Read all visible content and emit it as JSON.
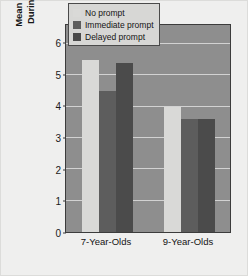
{
  "chart_data": {
    "type": "bar",
    "title": "",
    "xlabel": "",
    "ylabel": "Mean Number of Errors During Recall of List 1",
    "ylabel_lines": [
      "Mean Number of Errors",
      "During Recall of List 1"
    ],
    "categories": [
      "7-Year-Olds",
      "9-Year-Olds"
    ],
    "series": [
      {
        "name": "No prompt",
        "values": [
          5.5,
          4.0
        ],
        "color": "#d9d9d7"
      },
      {
        "name": "Immediate prompt",
        "values": [
          4.5,
          3.6
        ],
        "color": "#5d5d5d"
      },
      {
        "name": "Delayed prompt",
        "values": [
          5.4,
          3.6
        ],
        "color": "#4b4b4b"
      }
    ],
    "ylim": [
      0,
      6.6
    ],
    "yticks": [
      0,
      1,
      2,
      3,
      4,
      5,
      6
    ],
    "ytick_labels": [
      "0",
      "1",
      "2",
      "3",
      "4",
      "5",
      "6"
    ],
    "grid": true,
    "gridlines_at": [
      1,
      2,
      3,
      4,
      5,
      6
    ],
    "legend_position": "top-right",
    "plot_background": "#8e8e8e",
    "gridline_color": "#d2d2d2",
    "figure_background": "#efefee",
    "axis_color": "#3c3c3c"
  },
  "legend": {
    "items": [
      {
        "label": "No prompt",
        "color": "#d9d9d7"
      },
      {
        "label": "Immediate prompt",
        "color": "#5d5d5d"
      },
      {
        "label": "Delayed prompt",
        "color": "#4b4b4b"
      }
    ]
  }
}
